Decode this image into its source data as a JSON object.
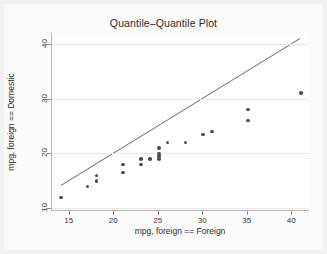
{
  "chart_data": {
    "type": "scatter",
    "title": "Quantile–Quantile Plot",
    "xlabel": "mpg, foreign == Foreign",
    "ylabel": "mpg, foreign == Domestic",
    "xlim": [
      13,
      42
    ],
    "ylim": [
      9.5,
      42
    ],
    "xticks": [
      15,
      20,
      25,
      30,
      35,
      40
    ],
    "yticks": [
      10,
      20,
      30,
      40
    ],
    "grid": "horizontal",
    "legend": "none",
    "marker_color": "#4d4d55",
    "reference_line": {
      "name": "y = x reference line",
      "color": "#555555",
      "x": [
        14,
        41
      ],
      "y": [
        14,
        41
      ]
    },
    "points": [
      {
        "x": 14,
        "y": 12
      },
      {
        "x": 17,
        "y": 14
      },
      {
        "x": 18,
        "y": 15
      },
      {
        "x": 18,
        "y": 16
      },
      {
        "x": 21,
        "y": 16.5
      },
      {
        "x": 21,
        "y": 18
      },
      {
        "x": 23,
        "y": 18
      },
      {
        "x": 23,
        "y": 19
      },
      {
        "x": 24,
        "y": 19
      },
      {
        "x": 25,
        "y": 19
      },
      {
        "x": 25,
        "y": 19.5
      },
      {
        "x": 25,
        "y": 20
      },
      {
        "x": 25,
        "y": 21
      },
      {
        "x": 26,
        "y": 22
      },
      {
        "x": 28,
        "y": 22
      },
      {
        "x": 30,
        "y": 23.5
      },
      {
        "x": 31,
        "y": 24
      },
      {
        "x": 35,
        "y": 26
      },
      {
        "x": 35,
        "y": 28
      },
      {
        "x": 41,
        "y": 31
      }
    ]
  }
}
